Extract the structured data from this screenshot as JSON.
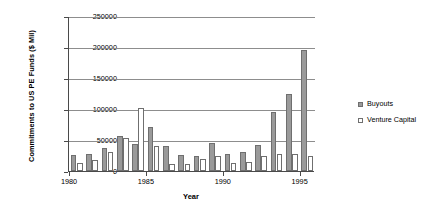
{
  "chart_data": {
    "type": "bar",
    "title": "",
    "xlabel": "Year",
    "ylabel": "Commitments to US PE Funds ($ Mil)",
    "categories": [
      1980,
      1981,
      1982,
      1983,
      1984,
      1985,
      1986,
      1987,
      1988,
      1989,
      1990,
      1991,
      1992,
      1993,
      1994,
      1995
    ],
    "xtick_labels": [
      "1980",
      "1985",
      "1990",
      "1995"
    ],
    "xtick_values": [
      1980,
      1985,
      1990,
      1995
    ],
    "ytick_labels": [
      "0",
      "50000",
      "100000",
      "150000",
      "200000",
      "250000"
    ],
    "ytick_values": [
      0,
      50000,
      100000,
      150000,
      200000,
      250000
    ],
    "ylim": [
      0,
      250000
    ],
    "grid": true,
    "legend_position": "right",
    "series": [
      {
        "name": "Buyouts",
        "color": "#9a9a9a",
        "values": [
          26000,
          28000,
          37000,
          56000,
          43000,
          71000,
          41000,
          26000,
          25000,
          45000,
          27000,
          31000,
          42000,
          95000,
          125000,
          195000
        ]
      },
      {
        "name": "Venture Capital",
        "color": "#ffffff",
        "values": [
          13000,
          18000,
          31000,
          53000,
          102000,
          40000,
          12000,
          11000,
          19000,
          24000,
          13000,
          15000,
          25000,
          27000,
          27000,
          25000
        ]
      }
    ]
  },
  "legend": {
    "items": [
      {
        "label": "Buyouts",
        "swatch": "buyouts"
      },
      {
        "label": "Venture Capital",
        "swatch": "vc"
      }
    ]
  }
}
